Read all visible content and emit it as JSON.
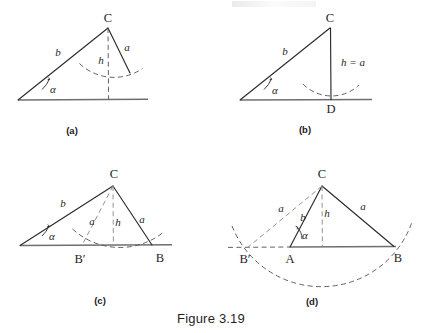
{
  "figure": {
    "caption": "Figure 3.19",
    "caption_pos": {
      "x": 211,
      "y": 318
    }
  },
  "panels": [
    {
      "id": "a",
      "sublabel": "(a)",
      "sublabel_pos": {
        "x": 72,
        "y": 130
      },
      "description": "Acute angle alpha with side b; side a too short to reach the base line, dashed arc of radius a centered at C misses the base line (no solution).",
      "labels": [
        {
          "name": "vertex-C",
          "text": "C",
          "x": 108,
          "y": 18,
          "style": "upright"
        },
        {
          "name": "side-b",
          "text": "b",
          "x": 58,
          "y": 52,
          "style": "italic"
        },
        {
          "name": "side-a",
          "text": "a",
          "x": 127,
          "y": 47,
          "style": "italic"
        },
        {
          "name": "height-h",
          "text": "h",
          "x": 101,
          "y": 60,
          "style": "italic"
        },
        {
          "name": "angle-alpha",
          "text": "α",
          "x": 53,
          "y": 89,
          "style": "italic"
        }
      ]
    },
    {
      "id": "b",
      "sublabel": "(b)",
      "sublabel_pos": {
        "x": 305,
        "y": 129
      },
      "description": "Right-triangle case: a equals h, the arc is tangent to the base line at D (exactly one solution).",
      "labels": [
        {
          "name": "vertex-C",
          "text": "C",
          "x": 330,
          "y": 18,
          "style": "upright"
        },
        {
          "name": "side-b",
          "text": "b",
          "x": 285,
          "y": 51,
          "style": "italic"
        },
        {
          "name": "height-equals-a",
          "text": "h = a",
          "x": 353,
          "y": 62,
          "style": "italic"
        },
        {
          "name": "angle-alpha",
          "text": "α",
          "x": 275,
          "y": 90,
          "style": "italic"
        },
        {
          "name": "vertex-D",
          "text": "D",
          "x": 331,
          "y": 109,
          "style": "upright"
        }
      ]
    },
    {
      "id": "c",
      "sublabel": "(c)",
      "sublabel_pos": {
        "x": 100,
        "y": 300
      },
      "description": "Ambiguous case: arc of radius a cuts the base line twice, at B' and at B (two solutions).",
      "labels": [
        {
          "name": "vertex-C",
          "text": "C",
          "x": 114,
          "y": 174,
          "style": "upright"
        },
        {
          "name": "side-b",
          "text": "b",
          "x": 63,
          "y": 203,
          "style": "italic"
        },
        {
          "name": "side-a-left",
          "text": "a",
          "x": 92,
          "y": 221,
          "style": "italic"
        },
        {
          "name": "height-h",
          "text": "h",
          "x": 118,
          "y": 222,
          "style": "italic"
        },
        {
          "name": "side-a-right",
          "text": "a",
          "x": 142,
          "y": 219,
          "style": "italic"
        },
        {
          "name": "angle-alpha",
          "text": "α",
          "x": 52,
          "y": 236,
          "style": "italic"
        },
        {
          "name": "vertex-B-prime",
          "text": "B′",
          "x": 80,
          "y": 259,
          "style": "upright"
        },
        {
          "name": "vertex-B",
          "text": "B",
          "x": 160,
          "y": 258,
          "style": "upright"
        }
      ]
    },
    {
      "id": "d",
      "sublabel": "(d)",
      "sublabel_pos": {
        "x": 312,
        "y": 301
      },
      "description": "Case a greater than b: the second intersection B' falls on the extension of the base line to the left of A, so only one triangle exists.",
      "labels": [
        {
          "name": "vertex-C",
          "text": "C",
          "x": 322,
          "y": 174,
          "style": "upright"
        },
        {
          "name": "side-a-left",
          "text": "a",
          "x": 281,
          "y": 208,
          "style": "italic"
        },
        {
          "name": "side-b",
          "text": "b",
          "x": 303,
          "y": 217,
          "style": "italic"
        },
        {
          "name": "height-h",
          "text": "h",
          "x": 327,
          "y": 213,
          "style": "italic"
        },
        {
          "name": "side-a-right",
          "text": "a",
          "x": 363,
          "y": 206,
          "style": "italic"
        },
        {
          "name": "angle-alpha",
          "text": "α",
          "x": 305,
          "y": 235,
          "style": "italic"
        },
        {
          "name": "vertex-B-prime",
          "text": "B′",
          "x": 245,
          "y": 259,
          "style": "upright"
        },
        {
          "name": "vertex-A",
          "text": "A",
          "x": 290,
          "y": 259,
          "style": "upright"
        },
        {
          "name": "vertex-B",
          "text": "B",
          "x": 398,
          "y": 258,
          "style": "upright"
        }
      ]
    }
  ],
  "colors": {
    "ink": "#2b2b2b",
    "dashed": "#5a5a5a",
    "dashed_light": "#8d8d8d",
    "baseline": "#6f6f6f",
    "background": "#ffffff"
  }
}
